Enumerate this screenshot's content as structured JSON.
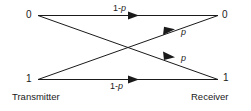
{
  "diagram": {
    "background_color": "#ffffff",
    "line_color": "#1a1a1a",
    "nodes": {
      "transmitter_0": "0",
      "transmitter_1": "1",
      "receiver_0": "0",
      "receiver_1": "1"
    },
    "captions": {
      "transmitter": "Transmitter",
      "receiver": "Receiver"
    },
    "edges": [
      {
        "name": "tx0-to-rx0",
        "label_prefix": "1-",
        "label_variable": "p",
        "label_full": "1-p",
        "from": "transmitter_0",
        "to": "receiver_0"
      },
      {
        "name": "tx1-to-rx1",
        "label_prefix": "1-",
        "label_variable": "p",
        "label_full": "1-p",
        "from": "transmitter_1",
        "to": "receiver_1"
      },
      {
        "name": "tx0-to-rx1",
        "label_prefix": "",
        "label_variable": "p",
        "label_full": "p",
        "from": "transmitter_0",
        "to": "receiver_1"
      },
      {
        "name": "tx1-to-rx0",
        "label_prefix": "",
        "label_variable": "p",
        "label_full": "p",
        "from": "transmitter_1",
        "to": "receiver_0"
      }
    ]
  }
}
